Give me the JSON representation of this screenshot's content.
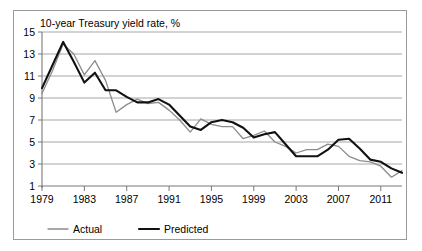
{
  "frame": {
    "border_color": "#9a9a9a",
    "background": "#ffffff"
  },
  "chart_data": {
    "type": "line",
    "title": "10-year Treasury yield rate, %",
    "xlabel": "",
    "ylabel": "",
    "xlim": [
      1979,
      2013
    ],
    "ylim": [
      1,
      15
    ],
    "yticks": [
      1,
      3,
      5,
      7,
      9,
      11,
      13,
      15
    ],
    "xticks": [
      1979,
      1983,
      1987,
      1991,
      1995,
      1999,
      2003,
      2007,
      2011
    ],
    "grid": "horizontal",
    "legend_position": "bottom-left",
    "x": [
      1979,
      1980,
      1981,
      1982,
      1983,
      1984,
      1985,
      1986,
      1987,
      1988,
      1989,
      1990,
      1991,
      1992,
      1993,
      1994,
      1995,
      1996,
      1997,
      1998,
      1999,
      2000,
      2001,
      2002,
      2003,
      2004,
      2005,
      2006,
      2007,
      2008,
      2009,
      2010,
      2011,
      2012,
      2013
    ],
    "series": [
      {
        "name": "Actual",
        "color": "#8c8c8c",
        "width": 1.3,
        "values": [
          9.4,
          11.5,
          13.9,
          13.0,
          11.1,
          12.4,
          10.6,
          7.7,
          8.4,
          8.9,
          8.5,
          8.6,
          7.9,
          7.0,
          5.9,
          7.1,
          6.6,
          6.4,
          6.4,
          5.3,
          5.6,
          6.0,
          5.0,
          4.6,
          4.0,
          4.3,
          4.3,
          4.8,
          4.6,
          3.7,
          3.3,
          3.2,
          2.8,
          1.8,
          2.4
        ]
      },
      {
        "name": "Predicted",
        "color": "#111111",
        "width": 2.1,
        "values": [
          9.9,
          12.0,
          14.1,
          12.3,
          10.4,
          11.3,
          9.7,
          9.7,
          9.1,
          8.6,
          8.6,
          8.9,
          8.4,
          7.4,
          6.4,
          6.1,
          6.8,
          7.0,
          6.8,
          6.3,
          5.4,
          5.7,
          5.9,
          4.8,
          3.7,
          3.7,
          3.7,
          4.3,
          5.2,
          5.3,
          4.4,
          3.4,
          3.2,
          2.6,
          2.2
        ]
      }
    ],
    "legend": [
      {
        "label": "Actual",
        "color": "#8c8c8c",
        "width": 1.3
      },
      {
        "label": "Predicted",
        "color": "#111111",
        "width": 2.1
      }
    ]
  }
}
